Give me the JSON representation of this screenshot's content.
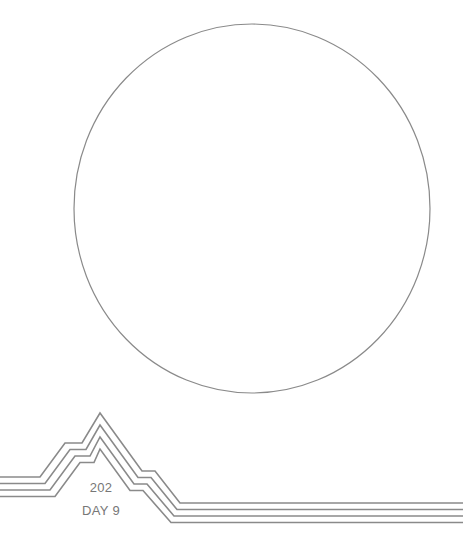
{
  "artwork": {
    "circle": {
      "cx": 252,
      "cy": 208.5,
      "rx": 178,
      "ry": 184.5,
      "stroke": "#8a8a8a",
      "stroke_width": 1.2
    },
    "mountain_lines": {
      "count": 4,
      "spacing": 6.5,
      "stroke": "#8a8a8a",
      "stroke_width": 1.6
    }
  },
  "caption": {
    "number": "202",
    "day": "DAY 9"
  },
  "colors": {
    "line": "#8a8a8a",
    "text": "#777777",
    "background": "#ffffff"
  }
}
